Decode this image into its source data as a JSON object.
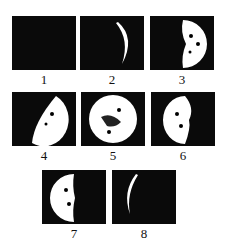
{
  "panels": [
    {
      "label": "1",
      "phase": "new-moon"
    },
    {
      "label": "2",
      "phase": "waxing-crescent"
    },
    {
      "label": "3",
      "phase": "first-quarter"
    },
    {
      "label": "4",
      "phase": "waxing-gibbous"
    },
    {
      "label": "5",
      "phase": "full-moon"
    },
    {
      "label": "6",
      "phase": "waning-gibbous"
    },
    {
      "label": "7",
      "phase": "last-quarter"
    },
    {
      "label": "8",
      "phase": "waning-crescent"
    }
  ],
  "colors": {
    "panel": "#0a0a0a",
    "moon": "#ffffff"
  }
}
